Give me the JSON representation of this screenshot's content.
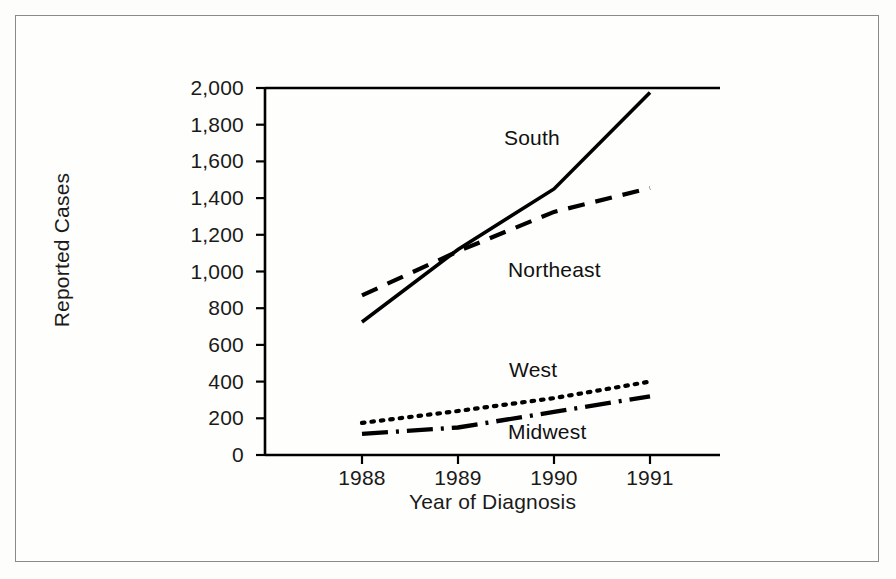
{
  "chart_data": {
    "type": "line",
    "title": "",
    "xlabel": "Year of Diagnosis",
    "ylabel": "Reported Cases",
    "x": [
      1988,
      1989,
      1990,
      1991
    ],
    "xticklabels": [
      "1988",
      "1989",
      "1990",
      "1991"
    ],
    "yticks": [
      0,
      200,
      400,
      600,
      800,
      1000,
      1200,
      1400,
      1600,
      1800,
      2000
    ],
    "yticklabels": [
      "0",
      "200",
      "400",
      "600",
      "800",
      "1,000",
      "1,200",
      "1,400",
      "1,600",
      "1,800",
      "2,000"
    ],
    "ylim": [
      0,
      2000
    ],
    "xlim": [
      1987.0,
      1991.73
    ],
    "grid": false,
    "legend": "inline-annotations",
    "series": [
      {
        "name": "South",
        "style": "solid",
        "color": "#000000",
        "values": [
          725,
          1120,
          1450,
          1975
        ],
        "label_x": 1989.05,
        "label_y": 1700
      },
      {
        "name": "Northeast",
        "style": "dashed",
        "color": "#000000",
        "values": [
          870,
          1110,
          1325,
          1455
        ],
        "label_x": 1989.55,
        "label_y": 1060
      },
      {
        "name": "West",
        "style": "dotted",
        "color": "#000000",
        "values": [
          175,
          240,
          310,
          400
        ],
        "label_x": 1989.4,
        "label_y": 460
      },
      {
        "name": "Midwest",
        "style": "dashdot",
        "color": "#000000",
        "values": [
          115,
          150,
          235,
          320
        ],
        "label_x": 1989.45,
        "label_y": 130
      }
    ]
  }
}
